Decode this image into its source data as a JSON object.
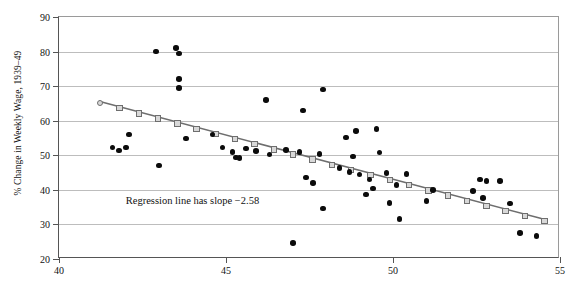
{
  "chart_data": {
    "type": "scatter",
    "title": "",
    "xlabel": "",
    "ylabel": "% Change in Weekly Wage, 1939–49",
    "xlim": [
      40,
      55
    ],
    "ylim": [
      20,
      90
    ],
    "xticks": [
      40,
      45,
      50,
      55
    ],
    "yticks": [
      20,
      30,
      40,
      50,
      60,
      70,
      80,
      90
    ],
    "grid": "horizontal",
    "legend": "none",
    "annotations": [
      {
        "text": "Regression line has slope −2.58",
        "x": 42.0,
        "y": 36.5
      }
    ],
    "series": [
      {
        "name": "observations",
        "marker": "filled-circle",
        "color": "#0b0b0b",
        "points": [
          [
            41.6,
            52.2
          ],
          [
            41.8,
            51.4
          ],
          [
            42.0,
            52.3
          ],
          [
            42.1,
            56.0
          ],
          [
            42.9,
            80.0
          ],
          [
            43.0,
            47.0
          ],
          [
            43.5,
            81.0
          ],
          [
            43.6,
            79.4
          ],
          [
            43.6,
            72.0
          ],
          [
            43.6,
            69.4
          ],
          [
            43.8,
            54.8
          ],
          [
            44.6,
            56.0
          ],
          [
            44.9,
            52.3
          ],
          [
            45.2,
            51.0
          ],
          [
            45.3,
            49.4
          ],
          [
            45.4,
            49.2
          ],
          [
            45.6,
            52.0
          ],
          [
            45.9,
            51.2
          ],
          [
            46.2,
            66.0
          ],
          [
            46.3,
            50.2
          ],
          [
            46.8,
            51.6
          ],
          [
            47.0,
            24.6
          ],
          [
            47.2,
            51.0
          ],
          [
            47.3,
            63.0
          ],
          [
            47.4,
            43.6
          ],
          [
            47.6,
            42.0
          ],
          [
            47.8,
            50.4
          ],
          [
            47.9,
            69.0
          ],
          [
            47.9,
            34.6
          ],
          [
            48.4,
            46.4
          ],
          [
            48.6,
            55.2
          ],
          [
            48.7,
            45.2
          ],
          [
            48.8,
            49.6
          ],
          [
            48.9,
            57.0
          ],
          [
            49.0,
            44.4
          ],
          [
            49.2,
            38.6
          ],
          [
            49.3,
            43.0
          ],
          [
            49.4,
            40.4
          ],
          [
            49.5,
            57.6
          ],
          [
            49.6,
            50.8
          ],
          [
            49.8,
            44.8
          ],
          [
            49.9,
            36.2
          ],
          [
            50.1,
            41.4
          ],
          [
            50.2,
            31.6
          ],
          [
            50.4,
            44.6
          ],
          [
            51.0,
            36.8
          ],
          [
            51.2,
            40.0
          ],
          [
            52.4,
            39.6
          ],
          [
            52.6,
            43.0
          ],
          [
            52.7,
            37.6
          ],
          [
            52.8,
            42.6
          ],
          [
            53.2,
            42.6
          ],
          [
            53.5,
            36.0
          ],
          [
            53.8,
            27.6
          ],
          [
            54.3,
            26.6
          ]
        ]
      }
    ],
    "regression": {
      "name": "regression line",
      "slope": -2.58,
      "color": "#6e6e6e",
      "marker": "open-square",
      "x_start": 41.2,
      "y_start": 65.4,
      "x_end": 54.5,
      "y_end": 31.2,
      "n_markers": 24
    }
  }
}
